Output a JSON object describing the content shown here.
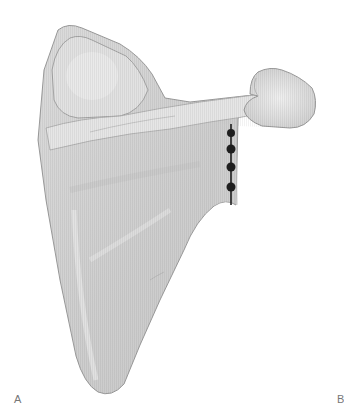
{
  "figure": {
    "panel_labels": [
      "A",
      "B"
    ],
    "colors": {
      "bone_fill": "#d6d6d6",
      "bone_highlight": "#ececec",
      "bone_shadow": "#b8b8b8",
      "outline": "#9a9a9a",
      "anchor": "#1e1e1e"
    },
    "anchors": {
      "count": 4,
      "x": 231,
      "y": [
        133,
        149,
        167,
        187
      ]
    }
  }
}
